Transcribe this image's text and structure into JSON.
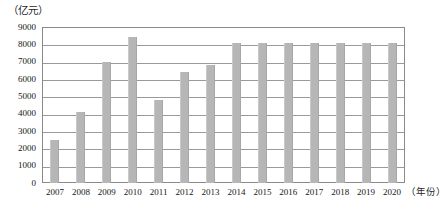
{
  "chart_data": {
    "type": "bar",
    "title": "",
    "subtitle": "",
    "unit_label": "（亿元）",
    "xlabel": "（年份）",
    "ylabel": "",
    "ylim": [
      0,
      9000
    ],
    "ytick_step": 1000,
    "grid": true,
    "legend": "none",
    "bar_color": "#b6b6b6",
    "axis_color": "#8a8a8a",
    "categories": [
      "2007",
      "2008",
      "2009",
      "2010",
      "2011",
      "2012",
      "2013",
      "2014",
      "2015",
      "2016",
      "2017",
      "2018",
      "2019",
      "2020"
    ],
    "values": [
      2500,
      4100,
      7000,
      8400,
      4800,
      6400,
      6800,
      8100,
      8100,
      8100,
      8100,
      8100,
      8100,
      8100
    ],
    "ytick_labels": [
      "9000",
      "8000",
      "7000",
      "6000",
      "5000",
      "4000",
      "3000",
      "2000",
      "1000",
      "0"
    ],
    "ytick_values": [
      9000,
      8000,
      7000,
      6000,
      5000,
      4000,
      3000,
      2000,
      1000,
      0
    ]
  }
}
